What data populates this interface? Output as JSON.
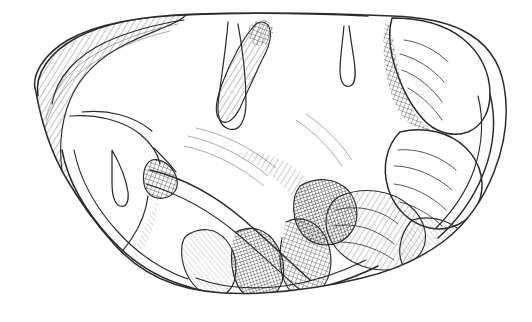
{
  "figure": {
    "kind": "anatomical-line-engraving",
    "view": "lateral-oblique",
    "title": "",
    "caption": "",
    "background_color": "#ffffff",
    "ink_color": "#2b2b2b",
    "hatch_color": "#575757",
    "canvas": {
      "width": 532,
      "height": 322
    }
  },
  "regions": [
    {
      "id": "frontal-pole",
      "label": "frontal pole",
      "side": "left"
    },
    {
      "id": "cerebral-hemisphere",
      "label": "cerebral hemisphere",
      "side": "left-center"
    },
    {
      "id": "dorsal-ridge",
      "label": "dorsal ridge",
      "side": "top-center"
    },
    {
      "id": "median-sulcus",
      "label": "median longitudinal sulcus",
      "side": "top-center"
    },
    {
      "id": "temporal-lobe",
      "label": "temporal lobe",
      "side": "bottom-center"
    },
    {
      "id": "cerebellum",
      "label": "cerebellum",
      "side": "right"
    },
    {
      "id": "cerebellar-folia",
      "label": "cerebellar folia",
      "side": "right"
    },
    {
      "id": "brainstem-notch",
      "label": "brainstem notch",
      "side": "right-lower"
    }
  ],
  "strokes": {
    "outline": "M 36 92 C 30 76 44 54 68 40 C 96 24 138 16 196 14 C 262 12 330 13 392 16 C 420 17 444 21 462 30 C 486 42 500 62 504 86 C 509 114 505 144 494 172 C 483 200 466 224 444 241 C 420 259 392 271 362 278 C 330 286 296 291 262 293 C 228 295 198 292 174 284 C 150 276 130 262 114 244 C 96 224 80 202 66 178 C 52 154 42 126 36 92 Z",
    "dorsal_edge": "M 196 14 C 262 12 330 13 392 16",
    "frontal_arc": "M 36 92 C 30 76 44 54 68 40 C 96 24 138 16 196 14",
    "cerebellum_boundary": "M 392 16 C 420 17 444 21 462 30 C 486 42 500 62 504 86 C 509 114 505 144 494 172 C 483 200 466 224 444 241",
    "sylvian_fissure": "M 92 120 C 136 116 178 126 210 150 C 244 176 272 208 300 238",
    "median_sulcus": "M 228 20 C 226 46 222 70 218 96 C 214 116 216 126 226 130 C 238 134 244 122 244 104 C 244 78 240 46 236 22"
  },
  "palette": {
    "paper": "#ffffff",
    "line_dark": "#2b2b2b",
    "line_mid": "#3a3a3a",
    "hatch": "#575757",
    "hatch_light": "#8a8a8a"
  }
}
